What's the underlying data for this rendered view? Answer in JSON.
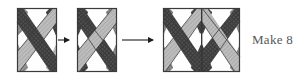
{
  "diagram": {
    "caption": "Make 8",
    "steps": [
      {
        "id": "block-a",
        "name": "half-block-dark-dominant",
        "shape": "vertical-rectangle",
        "x": 17,
        "y": 8,
        "w": 40,
        "h": 64,
        "pattern": "X-cross with dark crosshatch diagonal over medium grey diagonal, white triangles top and bottom, grey side triangles"
      },
      {
        "id": "block-b",
        "name": "half-block-light-dominant",
        "shape": "vertical-rectangle",
        "x": 77,
        "y": 8,
        "w": 40,
        "h": 64,
        "pattern": "X-cross with light grey diagonal over dark crosshatch diagonal, white triangles top and bottom, dark side triangles"
      },
      {
        "id": "block-c",
        "name": "joined-full-block",
        "shape": "square",
        "x": 163,
        "y": 8,
        "w": 77,
        "h": 64,
        "pattern": "block-a and block-b sewn side by side with centre seam"
      }
    ],
    "arrows": [
      {
        "id": "arrow-1",
        "name": "step-arrow-short",
        "x1": 59,
        "y1": 40,
        "x2": 72,
        "y2": 40
      },
      {
        "id": "arrow-2",
        "name": "step-arrow-long",
        "x1": 123,
        "y1": 40,
        "x2": 157,
        "y2": 40
      }
    ],
    "colors": {
      "outline": "#3b3b3b",
      "white": "#fefefe",
      "light_grey": "#b9b9b9",
      "mid_grey": "#8f8f8f",
      "dark_grey": "#5a5a5a",
      "crosshatch_dark": "#4d4d4d",
      "arrow": "#1e1e1e",
      "caption_color": "#55585a"
    }
  }
}
